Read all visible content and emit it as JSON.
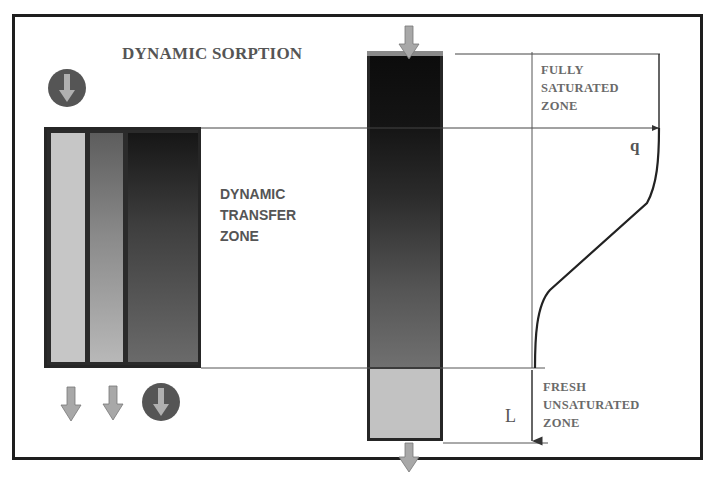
{
  "diagram": {
    "title": "DYNAMIC SORPTION",
    "transfer_zone_label": [
      "DYNAMIC",
      "TRANSFER",
      "ZONE"
    ],
    "saturated_zone_label": [
      "FULLY",
      "SATURATED",
      "ZONE"
    ],
    "unsaturated_zone_label": [
      "FRESH",
      "UNSATURATED",
      "ZONE"
    ],
    "q_label": "q",
    "length_label": "L",
    "icons": {
      "inflow_left": "circle-down-arrow-icon",
      "column_inflow": "down-arrow-icon",
      "column_outflow": "down-arrow-icon",
      "strip_outflows": [
        "down-arrow-icon",
        "down-arrow-icon",
        "circle-down-arrow-icon"
      ]
    },
    "colors": {
      "frame": "#1e1e1e",
      "text": "#555555",
      "arrow_fill": "#a8a8a8",
      "circle_fill": "#555555",
      "fresh_zone": "#c2c2c2",
      "saturated_zone": "#0c0c0c"
    }
  }
}
